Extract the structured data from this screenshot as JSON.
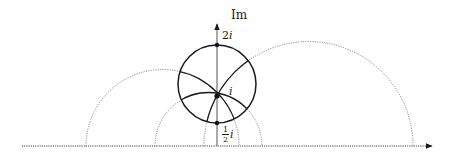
{
  "diagram": {
    "type": "hyperbolic upper half-plane",
    "labels": {
      "imaginary_axis": "Im",
      "point_top": "2",
      "point_top_unit": "i",
      "point_center": "i",
      "point_bottom_num": "1",
      "point_bottom_den": "2",
      "point_bottom_unit": "i"
    },
    "colors": {
      "solid": "#1a1a1a",
      "dotted": "#6a6a6a",
      "axis": "#555555"
    },
    "geometry": {
      "origin_px": [
        217,
        146
      ],
      "unit_px": 49,
      "hyperbolic_circle": {
        "through": [
          "2i",
          "1/2 i"
        ],
        "center_px": [
          217,
          84
        ],
        "radius_px": 39
      },
      "geodesics_through_i": [
        {
          "kind": "vertical line",
          "x_px": 217
        },
        {
          "kind": "semicircle",
          "from_px": 86,
          "to_px": 239
        },
        {
          "kind": "semicircle",
          "from_px": 155,
          "to_px": 262
        },
        {
          "kind": "semicircle",
          "from_px": 204,
          "to_px": 413
        }
      ],
      "marked_points": [
        "2i",
        "i",
        "1/2 i"
      ]
    }
  }
}
